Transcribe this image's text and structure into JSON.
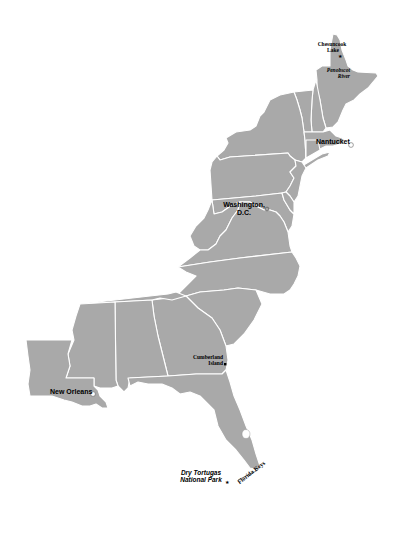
{
  "map": {
    "title": "Eastern United States",
    "colors": {
      "land": "#a9a9a9",
      "borders": "#ffffff",
      "background": "#ffffff",
      "text": "#000000"
    },
    "labels": {
      "chesuncook_lake": {
        "line1": "Chesuncook",
        "line2": "Lake",
        "marker": "star"
      },
      "penobscot_river": {
        "line1": "Penobscot",
        "line2": "River"
      },
      "nantucket": {
        "text": "Nantucket",
        "marker": "circle"
      },
      "washington_dc": {
        "line1": "Washington,",
        "line2": "D.C.",
        "marker": "star-in-circle"
      },
      "cumberland_island": {
        "line1": "Cumberland",
        "line2": "Island",
        "marker": "square"
      },
      "new_orleans": {
        "text": "New Orleans",
        "marker": "circle"
      },
      "dry_tortugas": {
        "line1": "Dry Tortugas",
        "line2": "National Park",
        "marker": "star"
      },
      "florida_keys": {
        "text": "Florida Keys"
      }
    }
  }
}
